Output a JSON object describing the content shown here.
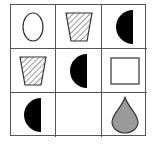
{
  "puzzle": {
    "rows": 3,
    "cols": 3,
    "cells": [
      {
        "row": 1,
        "col": 1,
        "shape": "ellipse",
        "fill": "white"
      },
      {
        "row": 1,
        "col": 2,
        "shape": "trapezoid",
        "fill": "hatched"
      },
      {
        "row": 1,
        "col": 3,
        "shape": "half-circle-left",
        "fill": "black"
      },
      {
        "row": 2,
        "col": 1,
        "shape": "trapezoid",
        "fill": "hatched"
      },
      {
        "row": 2,
        "col": 2,
        "shape": "half-circle-left",
        "fill": "black"
      },
      {
        "row": 2,
        "col": 3,
        "shape": "square",
        "fill": "white"
      },
      {
        "row": 3,
        "col": 1,
        "shape": "half-circle-left",
        "fill": "black"
      },
      {
        "row": 3,
        "col": 2,
        "shape": "empty",
        "fill": "none"
      },
      {
        "row": 3,
        "col": 3,
        "shape": "teardrop",
        "fill": "gray"
      }
    ],
    "colors": {
      "line": "#333333",
      "black_fill": "#000000",
      "gray_fill": "#9a9a9a",
      "grid_line": "#555555"
    }
  }
}
